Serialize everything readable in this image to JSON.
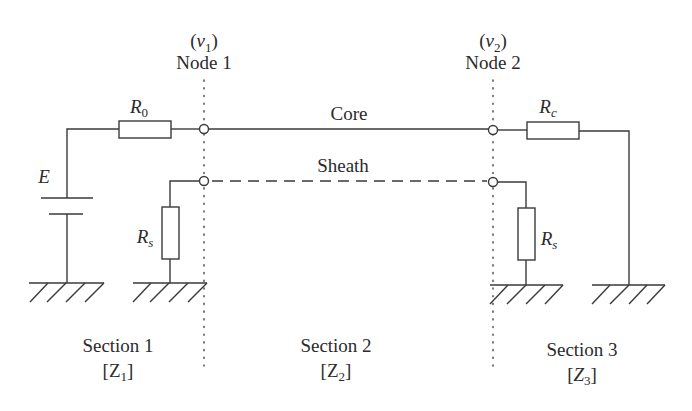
{
  "diagram": {
    "type": "circuit-schematic",
    "nodes": [
      {
        "id": "node1",
        "var": "ν",
        "var_sub": "1",
        "label": "Node 1"
      },
      {
        "id": "node2",
        "var": "ν",
        "var_sub": "2",
        "label": "Node 2"
      }
    ],
    "conductors": {
      "core": "Core",
      "sheath": "Sheath"
    },
    "components": {
      "source": {
        "symbol": "E"
      },
      "r0": {
        "symbol": "R",
        "sub": "0"
      },
      "rc": {
        "symbol": "R",
        "sub": "c"
      },
      "rs_left": {
        "symbol": "R",
        "sub": "s"
      },
      "rs_right": {
        "symbol": "R",
        "sub": "s"
      }
    },
    "sections": [
      {
        "label": "Section 1",
        "imp": "Z",
        "imp_sub": "1"
      },
      {
        "label": "Section 2",
        "imp": "Z",
        "imp_sub": "2"
      },
      {
        "label": "Section 3",
        "imp": "Z",
        "imp_sub": "3"
      }
    ],
    "colors": {
      "line": "#3a3a3a",
      "text": "#2b2b2b",
      "background": "#ffffff"
    }
  }
}
